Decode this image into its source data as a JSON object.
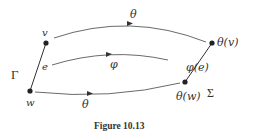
{
  "figure": {
    "caption": "Figure 10.13",
    "graph_gamma": {
      "name": "Γ",
      "vertices": [
        {
          "id": "v",
          "label": "v",
          "x": 46,
          "y": 43
        },
        {
          "id": "w",
          "label": "w",
          "x": 30,
          "y": 91
        }
      ],
      "edges": [
        {
          "id": "e",
          "label": "e",
          "from": "v",
          "to": "w"
        }
      ]
    },
    "graph_sigma": {
      "name": "Σ",
      "vertices": [
        {
          "id": "theta_v",
          "label": "θ(v)",
          "x": 212,
          "y": 43
        },
        {
          "id": "theta_w",
          "label": "θ(w)",
          "x": 185,
          "y": 82
        }
      ],
      "edges": [
        {
          "id": "phi_e",
          "label": "φ(e)",
          "from": "theta_w",
          "to": "theta_v"
        }
      ]
    },
    "maps": [
      {
        "label": "θ",
        "from": "v",
        "to": "θ(v)"
      },
      {
        "label": "φ",
        "from": "e",
        "to": "φ(e)"
      },
      {
        "label": "θ",
        "from": "w",
        "to": "θ(w)"
      }
    ],
    "colors": {
      "ink": "#333333",
      "background": "#ffffff"
    }
  }
}
